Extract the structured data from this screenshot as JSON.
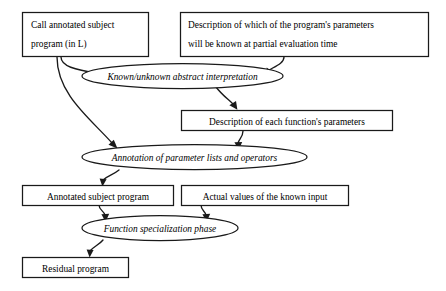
{
  "diagram": {
    "type": "flowchart",
    "background_color": "#ffffff",
    "line_color": "#1a1a1a",
    "text_color": "#000000",
    "nodes": {
      "call_annotated_subject_program": {
        "shape": "rectangle",
        "line1": "Call annotated subject",
        "line2": "program (in L)"
      },
      "description_of_known_parameters": {
        "shape": "rectangle",
        "line1": "Description of which of the program's parameters",
        "line2": "will be known at partial evaluation time"
      },
      "known_unknown_abstract_interpretation": {
        "shape": "ellipse",
        "label": "Known/unknown abstract interpretation"
      },
      "description_of_each_functions_parameters": {
        "shape": "rectangle",
        "label": "Description of each function's parameters"
      },
      "annotation_of_parameter_lists_and_operators": {
        "shape": "ellipse",
        "label": "Annotation of parameter lists and operators"
      },
      "annotated_subject_program": {
        "shape": "rectangle",
        "label": "Annotated subject program"
      },
      "actual_values_of_the_known_input": {
        "shape": "rectangle",
        "label": "Actual values of the known input"
      },
      "function_specialization_phase": {
        "shape": "ellipse",
        "label": "Function specialization phase"
      },
      "residual_program": {
        "shape": "rectangle",
        "label": "Residual program"
      }
    },
    "edges": [
      {
        "from": "call_annotated_subject_program",
        "to": "known_unknown_abstract_interpretation"
      },
      {
        "from": "call_annotated_subject_program",
        "to": "annotation_of_parameter_lists_and_operators"
      },
      {
        "from": "description_of_known_parameters",
        "to": "known_unknown_abstract_interpretation"
      },
      {
        "from": "known_unknown_abstract_interpretation",
        "to": "description_of_each_functions_parameters"
      },
      {
        "from": "description_of_each_functions_parameters",
        "to": "annotation_of_parameter_lists_and_operators"
      },
      {
        "from": "annotation_of_parameter_lists_and_operators",
        "to": "annotated_subject_program"
      },
      {
        "from": "annotated_subject_program",
        "to": "function_specialization_phase"
      },
      {
        "from": "actual_values_of_the_known_input",
        "to": "function_specialization_phase"
      },
      {
        "from": "function_specialization_phase",
        "to": "residual_program"
      }
    ]
  }
}
